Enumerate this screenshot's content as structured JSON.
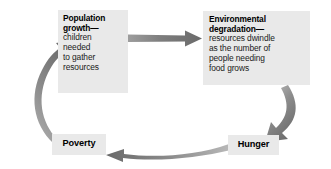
{
  "diagram": {
    "type": "cycle-flow",
    "colors": {
      "node_fill": "#e9e9e9",
      "arrow_dark": "#6b6b6b",
      "arrow_light": "#b5b5b5",
      "text": "#000000",
      "background": "#ffffff"
    },
    "nodes": [
      {
        "id": "population-growth",
        "heading": "Population growth—",
        "body": "children needed to gather resources",
        "body_lines": [
          "children",
          "needed",
          "to gather",
          "resources"
        ],
        "heading_lines": [
          "Population",
          "growth—"
        ]
      },
      {
        "id": "environmental-degradation",
        "heading": "Environmental degradation—",
        "body": "resources dwindle as the number of people needing food grows",
        "body_lines": [
          "resources dwindle",
          "as the number of",
          "people needing",
          "food grows"
        ],
        "heading_lines": [
          "Environmental",
          "degradation—"
        ]
      },
      {
        "id": "hunger",
        "label": "Hunger"
      },
      {
        "id": "poverty",
        "label": "Poverty"
      }
    ],
    "arrows": [
      {
        "id": "population-to-environmental",
        "from": "population-growth",
        "to": "environmental-degradation",
        "shape": "straight-right"
      },
      {
        "id": "environmental-to-hunger",
        "from": "environmental-degradation",
        "to": "hunger",
        "shape": "curve-down-left"
      },
      {
        "id": "hunger-to-poverty",
        "from": "hunger",
        "to": "poverty",
        "shape": "curve-left"
      },
      {
        "id": "poverty-to-population",
        "from": "poverty",
        "to": "population-growth",
        "shape": "curve-up-right"
      }
    ]
  }
}
